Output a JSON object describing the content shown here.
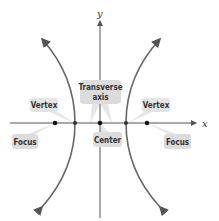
{
  "diagram": {
    "type": "hyperbola",
    "axes": {
      "x_label": "x",
      "y_label": "y"
    },
    "labels": {
      "transverse_axis_line1": "Transverse",
      "transverse_axis_line2": "axis",
      "vertex_left": "Vertex",
      "vertex_right": "Vertex",
      "focus_left": "Focus",
      "focus_right": "Focus",
      "center": "Center"
    },
    "colors": {
      "curve": "#666666",
      "axis": "#555555",
      "label_box": "#dcdcdc",
      "point": "#111111"
    }
  }
}
